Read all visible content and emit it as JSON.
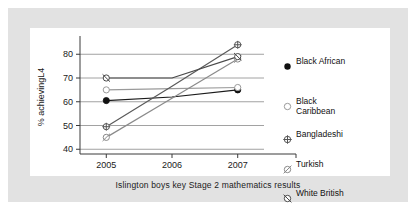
{
  "caption": "Islington boys key Stage 2 mathematics results",
  "chart_data": {
    "type": "line",
    "title": "Islington boys key Stage 2 mathematics results",
    "xlabel": "",
    "ylabel": "% achievingL4",
    "categories": [
      "2005",
      "2006",
      "2007"
    ],
    "x": [
      2005,
      2006,
      2007
    ],
    "xlim": [
      2004.6,
      2007.4
    ],
    "ylim": [
      38,
      86
    ],
    "ytick_labels": [
      "40",
      "50",
      "60",
      "70",
      "80"
    ],
    "yticks": [
      40,
      50,
      60,
      70,
      80
    ],
    "grid": true,
    "legend_position": "right",
    "series": [
      {
        "name": "Black African",
        "marker": "filled-circle",
        "color": "#1a1a1a",
        "values": [
          60.5,
          62.0,
          65.0
        ]
      },
      {
        "name": "Black Caribbean",
        "marker": "open-circle",
        "color": "#9a9a9a",
        "values": [
          65.0,
          65.5,
          66.0
        ]
      },
      {
        "name": "Bangladeshi",
        "marker": "crosshair-circle",
        "color": "#5a5a5a",
        "values": [
          49.5,
          66.5,
          84.0
        ]
      },
      {
        "name": "Turkish",
        "marker": "slash-circle",
        "color": "#8a8a8a",
        "values": [
          45.0,
          61.5,
          78.0
        ]
      },
      {
        "name": "White British",
        "marker": "backslash-circle",
        "color": "#4a4a4a",
        "values": [
          70.0,
          70.0,
          79.0
        ]
      }
    ]
  },
  "legend": {
    "items": [
      {
        "label": "Black African",
        "marker": "filled-circle"
      },
      {
        "label": "Black\nCaribbean",
        "marker": "open-circle"
      },
      {
        "label": "Bangladeshi",
        "marker": "crosshair-circle"
      },
      {
        "label": "Turkish",
        "marker": "slash-circle"
      },
      {
        "label": "White British",
        "marker": "backslash-circle"
      }
    ]
  }
}
